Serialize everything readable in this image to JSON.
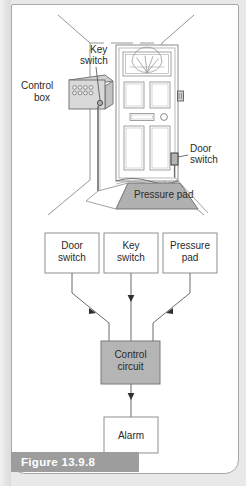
{
  "figure": {
    "caption": "Figure 13.9.8",
    "scene_labels": {
      "key_switch": [
        "Key",
        "switch"
      ],
      "control_box": [
        "Control",
        "box"
      ],
      "door_switch": [
        "Door",
        "switch"
      ],
      "pressure_pad": "Pressure pad"
    },
    "block_diagram": {
      "inputs": [
        {
          "line1": "Door",
          "line2": "switch"
        },
        {
          "line1": "Key",
          "line2": "switch"
        },
        {
          "line1": "Pressure",
          "line2": "pad"
        }
      ],
      "processor": {
        "line1": "Control",
        "line2": "circuit"
      },
      "output": {
        "line1": "Alarm",
        "line2": ""
      }
    },
    "colors": {
      "page_background": "#e9e9e9",
      "panel_background": "#ffffff",
      "panel_border": "#a9a9a9",
      "caption_bar": "#9d9d9d",
      "caption_text": "#ffffff",
      "line": "#6b6b6b",
      "dark_line": "#3d3d3d",
      "shaded_fill": "#b8b8b8",
      "light_fill": "#d6d6d6",
      "box_fill": "#ffffff",
      "control_circuit_fill": "#b5b5b5",
      "text": "#2a2a2a"
    }
  }
}
